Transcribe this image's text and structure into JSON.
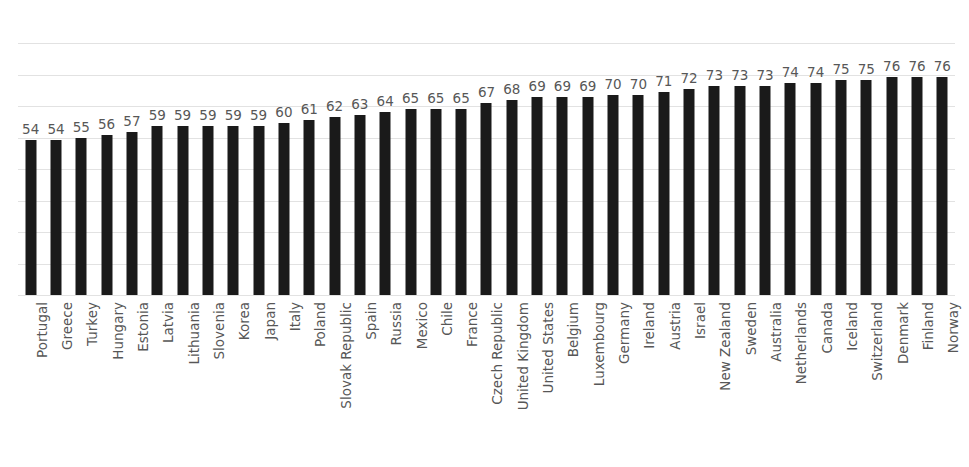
{
  "chart_data": {
    "type": "bar",
    "title": "",
    "subtitle": "",
    "xlabel": "",
    "ylabel": "",
    "ylim": [
      0,
      88
    ],
    "grid": true,
    "gridline_count": 9,
    "legend": null,
    "legend_position": "none",
    "orientation": "vertical",
    "bar_color": "#1a1a1a",
    "gridline_color": "#e2e2e2",
    "label_color": "#575757",
    "data_labels_shown": true,
    "categories": [
      "Portugal",
      "Greece",
      "Turkey",
      "Hungary",
      "Estonia",
      "Latvia",
      "Lithuania",
      "Slovenia",
      "Korea",
      "Japan",
      "Italy",
      "Poland",
      "Slovak Republic",
      "Spain",
      "Russia",
      "Mexico",
      "Chile",
      "France",
      "Czech Republic",
      "United Kingdom",
      "United States",
      "Belgium",
      "Luxembourg",
      "Germany",
      "Ireland",
      "Austria",
      "Israel",
      "New Zealand",
      "Sweden",
      "Australia",
      "Netherlands",
      "Canada",
      "Iceland",
      "Switzerland",
      "Denmark",
      "Finland",
      "Norway"
    ],
    "values": [
      54,
      54,
      55,
      56,
      57,
      59,
      59,
      59,
      59,
      59,
      60,
      61,
      62,
      63,
      64,
      65,
      65,
      65,
      67,
      68,
      69,
      69,
      69,
      70,
      70,
      71,
      72,
      73,
      73,
      73,
      74,
      74,
      75,
      75,
      76,
      76,
      76
    ]
  }
}
